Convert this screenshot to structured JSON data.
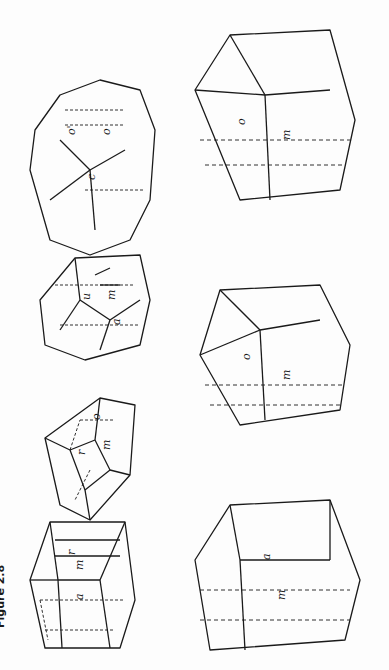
{
  "figure": {
    "caption": "Figure 2.8",
    "orientation": "rotated 90° counter-clockwise"
  },
  "crystals": [
    {
      "id": "crystal-1",
      "position": "top row, far left",
      "labels": [
        "r",
        "a",
        "m",
        "a",
        "a",
        "m"
      ]
    },
    {
      "id": "crystal-2",
      "position": "top row, second",
      "labels": [
        "o",
        "a",
        "r",
        "m",
        "a",
        "o",
        "r"
      ]
    },
    {
      "id": "crystal-3",
      "position": "top row, third",
      "labels": [
        "c",
        "r",
        "x",
        "u",
        "y",
        "u",
        "a",
        "m",
        "h",
        "a",
        "m",
        "o",
        "r"
      ]
    },
    {
      "id": "crystal-4",
      "position": "top row, far right (rounded)",
      "labels": [
        "a'''",
        "a''",
        "m'",
        "a'",
        "m,",
        "a",
        "h",
        "m",
        "a^v",
        "a^iv",
        "m''",
        "o'",
        "r''",
        "r'",
        "x",
        "o",
        "x",
        "c",
        "r'",
        "x",
        "o^iv"
      ]
    },
    {
      "id": "crystal-5",
      "position": "bottom row, left (outline)",
      "labels": [
        "o",
        "r",
        "o",
        "a",
        "a",
        "m",
        "a",
        "r"
      ]
    },
    {
      "id": "crystal-6",
      "position": "bottom row, middle",
      "labels": [
        "o",
        "o",
        "a",
        "m",
        "a",
        "a",
        "r",
        "a"
      ]
    },
    {
      "id": "crystal-7",
      "position": "bottom row, right",
      "labels": [
        "r",
        "o",
        "a",
        "m",
        "o",
        "a",
        "a",
        "m,",
        "r",
        "a"
      ]
    }
  ],
  "colors": {
    "ink": "#1a1a1a",
    "paper": "#fdfdfd"
  }
}
